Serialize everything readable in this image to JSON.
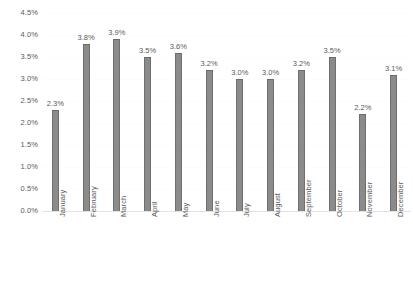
{
  "chart_data": {
    "type": "bar",
    "title": "",
    "subtitle": "",
    "xlabel": "",
    "ylabel": "",
    "categories": [
      "January",
      "February",
      "March",
      "April",
      "May",
      "June",
      "July",
      "August",
      "September",
      "October",
      "November",
      "December"
    ],
    "values": [
      2.3,
      3.8,
      3.9,
      3.5,
      3.6,
      3.2,
      3.0,
      3.0,
      3.2,
      3.5,
      2.2,
      3.1
    ],
    "data_labels": [
      "2.3%",
      "3.8%",
      "3.9%",
      "3.5%",
      "3.6%",
      "3.2%",
      "3.0%",
      "3.0%",
      "3.2%",
      "3.5%",
      "2.2%",
      "3.1%"
    ],
    "ylim": [
      0.0,
      4.5
    ],
    "ytick_values": [
      0.0,
      0.5,
      1.0,
      1.5,
      2.0,
      2.5,
      3.0,
      3.5,
      4.0,
      4.5
    ],
    "ytick_labels": [
      "0.0%",
      "0.5%",
      "1.0%",
      "1.5%",
      "2.0%",
      "2.5%",
      "3.0%",
      "3.5%",
      "4.0%",
      "4.5%"
    ],
    "grid": true,
    "legend": false,
    "legend_position": "none",
    "series": [
      {
        "name": "",
        "values": [
          2.3,
          3.8,
          3.9,
          3.5,
          3.6,
          3.2,
          3.0,
          3.0,
          3.2,
          3.5,
          2.2,
          3.1
        ]
      }
    ],
    "colors": {
      "bar_fill": "#8b8b8b",
      "bar_edge": "#6f6f6f",
      "label_text": "#5a5a5a",
      "gridline": "#fcfcfc",
      "axis_line": "#e2e2e2",
      "background": "#ffffff"
    }
  }
}
